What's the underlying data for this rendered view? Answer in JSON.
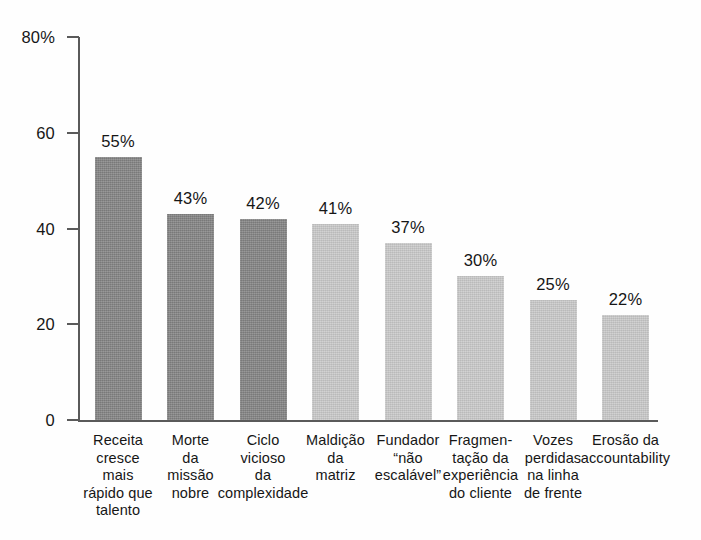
{
  "chart_data": {
    "type": "bar",
    "title": "",
    "subtitle": "",
    "xlabel": "",
    "ylabel": "",
    "ylim": [
      0,
      80
    ],
    "grid": false,
    "legend": false,
    "legend_position": "none",
    "y_ticks": [
      "0",
      "20",
      "40",
      "60",
      "80%"
    ],
    "y_tick_values": [
      0,
      20,
      40,
      60,
      80
    ],
    "value_suffix": "%",
    "categories": [
      "Receita cresce mais rápido que talento",
      "Morte da missão nobre",
      "Ciclo vicioso da complexidade",
      "Maldição da matriz",
      "Fundador “não escalável”",
      "Fragmentação da experiência do cliente",
      "Vozes perdidas na linha de frente",
      "Erosão da accountability"
    ],
    "category_lines": [
      [
        "Receita",
        "cresce",
        "mais",
        "rápido que",
        "talento"
      ],
      [
        "Morte",
        "da",
        "missão",
        "nobre"
      ],
      [
        "Ciclo",
        "vicioso",
        "da",
        "complexidade"
      ],
      [
        "Maldição",
        "da",
        "matriz"
      ],
      [
        "Fundador",
        "“não",
        "escalável”"
      ],
      [
        "Fragmen-",
        "tação da",
        "experiência",
        "do cliente"
      ],
      [
        "Vozes",
        "perdidas",
        "na linha",
        "de frente"
      ],
      [
        "Erosão da",
        "accountability"
      ]
    ],
    "values": [
      55,
      43,
      42,
      41,
      37,
      30,
      25,
      22
    ],
    "data_labels": [
      "55%",
      "43%",
      "42%",
      "41%",
      "37%",
      "30%",
      "25%",
      "22%"
    ],
    "bar_shades": [
      "dark",
      "dark",
      "dark",
      "light",
      "light",
      "light",
      "light",
      "light"
    ],
    "colors": {
      "bar_dark": "#838383",
      "bar_light": "#c9c9c9",
      "axis": "#5a5a5a",
      "text": "#161616",
      "background": "#fefefe"
    }
  }
}
